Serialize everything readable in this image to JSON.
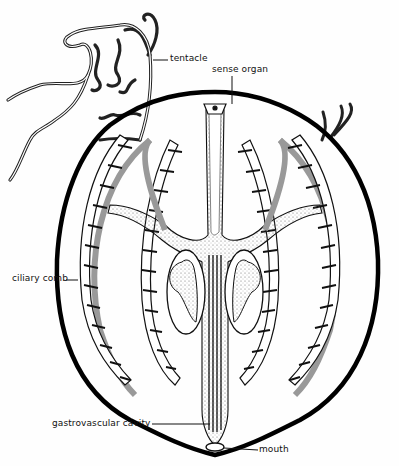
{
  "diagram": {
    "labels": {
      "tentacle": "tentacle",
      "sense_organ": "sense organ",
      "ciliary_comb": "ciliary comb",
      "gastrovascular_cavity": "gastrovascular cavity",
      "mouth": "mouth"
    },
    "colors": {
      "ink": "#111111",
      "background": "#fefefe",
      "stipple": "#777777"
    }
  }
}
